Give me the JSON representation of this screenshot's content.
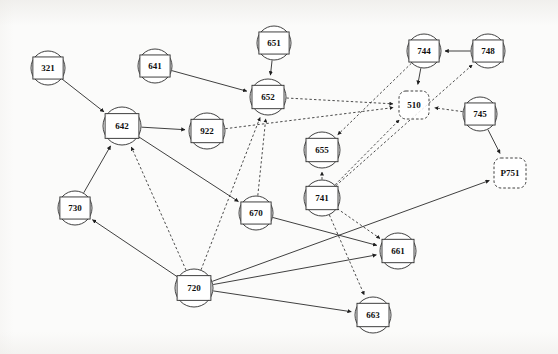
{
  "figure": {
    "title": "",
    "background_color": "#fbfbfa",
    "node_stroke_color": "#2b2b2b",
    "edge_color": "#1e1e1e",
    "label_color": "#101010"
  },
  "chart_data": {
    "type": "diagram",
    "subtype": "directed-graph",
    "title": "",
    "xlabel": "",
    "ylabel": "",
    "grid": false,
    "legend": [],
    "node_shapes": {
      "solid-circle-rect": "circle outline with inscribed rectangle, solid stroke",
      "dashed-rounded-rect": "rounded rectangle with dashed stroke"
    },
    "edge_styles": {
      "solid": "solid line with filled arrowhead",
      "dashed": "dashed line with filled arrowhead"
    },
    "nodes": [
      {
        "id": "321",
        "label": "321",
        "x": 48,
        "y": 68,
        "r": 17,
        "shape": "solid-circle-rect"
      },
      {
        "id": "641",
        "label": "641",
        "x": 155,
        "y": 66,
        "r": 17,
        "shape": "solid-circle-rect"
      },
      {
        "id": "651",
        "label": "651",
        "x": 274,
        "y": 43,
        "r": 17,
        "shape": "solid-circle-rect"
      },
      {
        "id": "744",
        "label": "744",
        "x": 424,
        "y": 51,
        "r": 17,
        "shape": "solid-circle-rect"
      },
      {
        "id": "748",
        "label": "748",
        "x": 488,
        "y": 51,
        "r": 17,
        "shape": "solid-circle-rect"
      },
      {
        "id": "652",
        "label": "652",
        "x": 268,
        "y": 97,
        "r": 18,
        "shape": "solid-circle-rect"
      },
      {
        "id": "510",
        "label": "510",
        "x": 414,
        "y": 105,
        "r": 17,
        "shape": "dashed-rounded-rect"
      },
      {
        "id": "745",
        "label": "745",
        "x": 480,
        "y": 114,
        "r": 17,
        "shape": "solid-circle-rect"
      },
      {
        "id": "642",
        "label": "642",
        "x": 122,
        "y": 126,
        "r": 19,
        "shape": "solid-circle-rect"
      },
      {
        "id": "922",
        "label": "922",
        "x": 207,
        "y": 131,
        "r": 18,
        "shape": "solid-circle-rect"
      },
      {
        "id": "655",
        "label": "655",
        "x": 322,
        "y": 150,
        "r": 18,
        "shape": "solid-circle-rect"
      },
      {
        "id": "P751",
        "label": "P751",
        "x": 510,
        "y": 173,
        "r": 18,
        "shape": "dashed-rounded-rect"
      },
      {
        "id": "741",
        "label": "741",
        "x": 322,
        "y": 198,
        "r": 18,
        "shape": "solid-circle-rect"
      },
      {
        "id": "730",
        "label": "730",
        "x": 75,
        "y": 208,
        "r": 17,
        "shape": "solid-circle-rect"
      },
      {
        "id": "670",
        "label": "670",
        "x": 256,
        "y": 213,
        "r": 17,
        "shape": "solid-circle-rect"
      },
      {
        "id": "661",
        "label": "661",
        "x": 398,
        "y": 251,
        "r": 18,
        "shape": "solid-circle-rect"
      },
      {
        "id": "720",
        "label": "720",
        "x": 194,
        "y": 288,
        "r": 19,
        "shape": "solid-circle-rect"
      },
      {
        "id": "663",
        "label": "663",
        "x": 373,
        "y": 315,
        "r": 18,
        "shape": "solid-circle-rect"
      }
    ],
    "edges": [
      {
        "from": "321",
        "to": "642",
        "style": "solid"
      },
      {
        "from": "641",
        "to": "652",
        "style": "solid"
      },
      {
        "from": "651",
        "to": "652",
        "style": "solid"
      },
      {
        "from": "748",
        "to": "744",
        "style": "solid"
      },
      {
        "from": "744",
        "to": "510",
        "style": "solid"
      },
      {
        "from": "744",
        "to": "655",
        "style": "dashed"
      },
      {
        "from": "745",
        "to": "510",
        "style": "dashed"
      },
      {
        "from": "745",
        "to": "P751",
        "style": "solid"
      },
      {
        "from": "652",
        "to": "510",
        "style": "dashed"
      },
      {
        "from": "922",
        "to": "510",
        "style": "dashed"
      },
      {
        "from": "642",
        "to": "922",
        "style": "solid"
      },
      {
        "from": "642",
        "to": "670",
        "style": "solid"
      },
      {
        "from": "670",
        "to": "652",
        "style": "dashed"
      },
      {
        "from": "670",
        "to": "661",
        "style": "solid"
      },
      {
        "from": "720",
        "to": "652",
        "style": "dashed"
      },
      {
        "from": "720",
        "to": "642",
        "style": "dashed"
      },
      {
        "from": "720",
        "to": "730",
        "style": "solid"
      },
      {
        "from": "730",
        "to": "642",
        "style": "solid"
      },
      {
        "from": "720",
        "to": "661",
        "style": "solid"
      },
      {
        "from": "720",
        "to": "663",
        "style": "solid"
      },
      {
        "from": "720",
        "to": "P751",
        "style": "solid"
      },
      {
        "from": "741",
        "to": "655",
        "style": "dashed"
      },
      {
        "from": "741",
        "to": "510",
        "style": "dashed"
      },
      {
        "from": "741",
        "to": "748",
        "style": "dashed"
      },
      {
        "from": "741",
        "to": "661",
        "style": "dashed"
      },
      {
        "from": "741",
        "to": "663",
        "style": "dashed"
      }
    ]
  }
}
